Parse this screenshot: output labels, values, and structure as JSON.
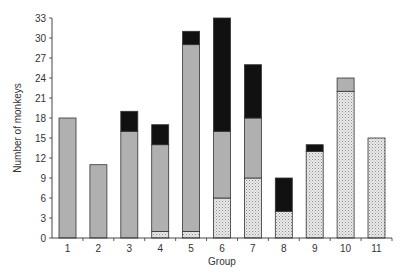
{
  "chart_data": {
    "type": "bar",
    "stacked": true,
    "title": "",
    "xlabel": "Group",
    "ylabel": "Number of monkeys",
    "ylim": [
      0,
      33
    ],
    "yticks": [
      0,
      3,
      6,
      9,
      12,
      15,
      18,
      21,
      24,
      27,
      30,
      33
    ],
    "categories": [
      "1",
      "2",
      "3",
      "4",
      "5",
      "6",
      "7",
      "8",
      "9",
      "10",
      "11"
    ],
    "grid": false,
    "legend": null,
    "series": [
      {
        "name": "dotted",
        "pattern": "dots",
        "color": "#e6e6e6",
        "values": [
          0,
          0,
          0,
          1,
          1,
          6,
          9,
          4,
          13,
          22,
          15
        ]
      },
      {
        "name": "gray",
        "pattern": "solid",
        "color": "#b0b0b0",
        "values": [
          18,
          11,
          16,
          13,
          28,
          10,
          9,
          0,
          0,
          2,
          0
        ]
      },
      {
        "name": "black",
        "pattern": "solid",
        "color": "#111111",
        "values": [
          0,
          0,
          3,
          3,
          2,
          17,
          8,
          5,
          1,
          0,
          0
        ]
      }
    ]
  }
}
